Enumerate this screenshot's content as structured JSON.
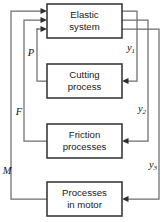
{
  "diagram": {
    "type": "block-diagram",
    "background_color": "#ffffff",
    "box_stroke_color": "#3b3b3b",
    "wire_color": "#6e6e6e",
    "arrow_color": "#2e2e2e",
    "text_color": "#1a1a1a",
    "blocks": [
      {
        "id": "elastic-system",
        "line1": "Elastic",
        "line2": "system",
        "x": 47,
        "y": 4,
        "w": 75,
        "h": 34
      },
      {
        "id": "cutting-process",
        "line1": "Cutting",
        "line2": "process",
        "x": 47,
        "y": 64,
        "w": 75,
        "h": 34
      },
      {
        "id": "friction-processes",
        "line1": "Friction",
        "line2": "processes",
        "x": 47,
        "y": 124,
        "w": 75,
        "h": 34
      },
      {
        "id": "processes-in-motor",
        "line1": "Processes",
        "line2": "in motor",
        "x": 47,
        "y": 182,
        "w": 75,
        "h": 34
      }
    ],
    "signals": [
      {
        "id": "y1",
        "base": "y",
        "sub": "1",
        "x": 131,
        "y": 49,
        "from": "elastic-system",
        "to": "cutting-process"
      },
      {
        "id": "y2",
        "base": "y",
        "sub": "2",
        "x": 142,
        "y": 110,
        "from": "elastic-system",
        "to": "friction-processes"
      },
      {
        "id": "y3",
        "base": "y",
        "sub": "3",
        "x": 153,
        "y": 166,
        "from": "elastic-system",
        "to": "processes-in-motor"
      },
      {
        "id": "P",
        "base": "P",
        "sub": "",
        "x": 31,
        "y": 54,
        "from": "cutting-process",
        "to": "elastic-system"
      },
      {
        "id": "F",
        "base": "F",
        "sub": "",
        "x": 19,
        "y": 113,
        "from": "friction-processes",
        "to": "elastic-system"
      },
      {
        "id": "M",
        "base": "M",
        "sub": "",
        "x": 7,
        "y": 172,
        "from": "processes-in-motor",
        "to": "elastic-system"
      }
    ]
  }
}
